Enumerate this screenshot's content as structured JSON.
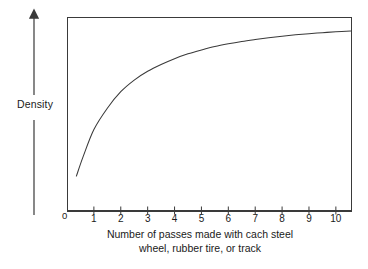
{
  "figure": {
    "background_color": "#ffffff",
    "line_color": "#3a3a3a",
    "text_color": "#1a1a1a"
  },
  "axes": {
    "y": {
      "label": "Density",
      "arrow": "up-arrow",
      "ticks": [],
      "origin_label": "0"
    },
    "x": {
      "caption_line1": "Number of passes made with cach steel",
      "caption_line2": "wheel, rubber tire, or track",
      "tick_labels": [
        "1",
        "2",
        "3",
        "4",
        "5",
        "6",
        "7",
        "8",
        "9",
        "10"
      ]
    }
  },
  "chart_data": {
    "type": "line",
    "title": "",
    "subtitle": "",
    "xlabel": "Number of passes made with cach steel wheel, rubber tire, or track",
    "ylabel": "Density",
    "grid": false,
    "legend": null,
    "xlim": [
      0,
      10.6
    ],
    "ylim": [
      0,
      1
    ],
    "xticks": [
      1,
      2,
      3,
      4,
      5,
      6,
      7,
      8,
      9,
      10
    ],
    "yticks": [],
    "series": [
      {
        "name": "Density vs passes",
        "x": [
          0.35,
          0.6,
          1.0,
          1.5,
          2.0,
          2.5,
          3.0,
          3.5,
          4.0,
          4.5,
          5.0,
          5.5,
          6.0,
          6.5,
          7.0,
          7.5,
          8.0,
          8.5,
          9.0,
          9.5,
          10.0,
          10.55
        ],
        "y": [
          0.18,
          0.28,
          0.42,
          0.53,
          0.615,
          0.675,
          0.72,
          0.755,
          0.785,
          0.81,
          0.83,
          0.848,
          0.862,
          0.874,
          0.884,
          0.893,
          0.901,
          0.908,
          0.914,
          0.919,
          0.924,
          0.928
        ]
      }
    ],
    "annotations": [
      "Curve rises steeply over the first few passes, then flattens toward an asymptotic maximum density."
    ]
  }
}
